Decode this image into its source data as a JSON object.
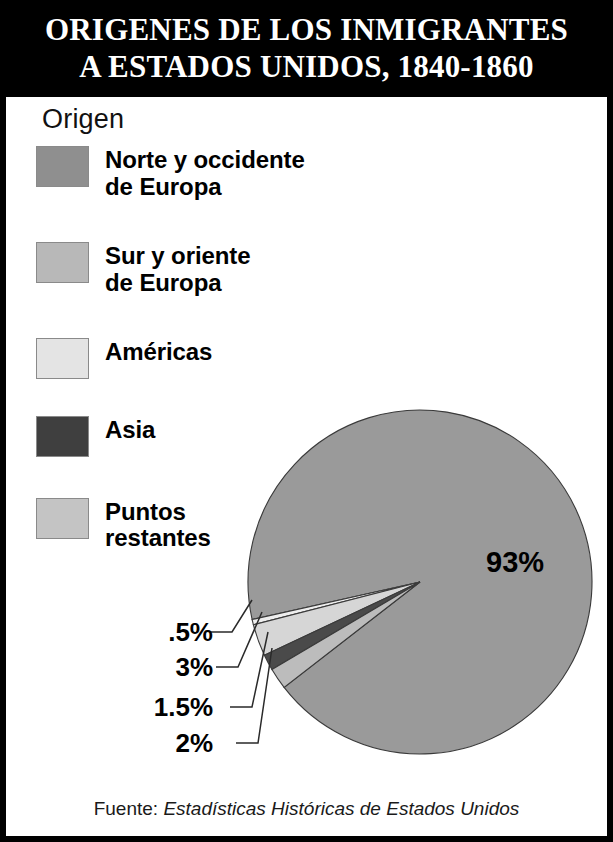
{
  "title": {
    "line1": "ORIGENES DE LOS INMIGRANTES",
    "line2": "A ESTADOS UNIDOS, 1840-1860"
  },
  "legend": {
    "heading": "Origen",
    "items": [
      {
        "label": "Norte y occidente\nde Europa",
        "color": "#8f8f8f"
      },
      {
        "label": "Sur y oriente\nde Europa",
        "color": "#b8b8b8"
      },
      {
        "label": "Américas",
        "color": "#e4e4e4"
      },
      {
        "label": "Asia",
        "color": "#3f3f3f"
      },
      {
        "label": "Puntos\nrestantes",
        "color": "#c4c4c4"
      }
    ]
  },
  "source": {
    "label": "Fuente: ",
    "publication": "Estadísticas Históricas de Estados Unidos"
  },
  "chart_data": {
    "type": "pie",
    "title": "ORIGENES DE LOS INMIGRANTES A ESTADOS UNIDOS, 1840-1860",
    "unit": "percent",
    "legend_position": "top-left",
    "center": {
      "x": 420,
      "y": 582
    },
    "radius": 172,
    "categories": [
      "Norte y occidente de Europa",
      "Sur y oriente de Europa",
      "Américas",
      "Asia",
      "Puntos restantes"
    ],
    "values": [
      93,
      0.5,
      3,
      1.5,
      2
    ],
    "labels": [
      "93%",
      ".5%",
      "3%",
      "1.5%",
      "2%"
    ],
    "colors": [
      "#9a9a9a",
      "#eeeeee",
      "#d6d6d6",
      "#4a4a4a",
      "#bcbcbc"
    ],
    "slices": [
      {
        "name": "Norte y occidente de Europa",
        "value": 93,
        "label": "93%",
        "color": "#9a9a9a",
        "start_deg": 167.4,
        "end_deg": 502.2
      },
      {
        "name": "Sur y oriente de Europa",
        "value": 0.5,
        "label": ".5%",
        "color": "#eeeeee",
        "start_deg": 165.6,
        "end_deg": 167.4
      },
      {
        "name": "Américas",
        "value": 3,
        "label": "3%",
        "color": "#d6d6d6",
        "start_deg": 154.8,
        "end_deg": 165.6
      },
      {
        "name": "Asia",
        "value": 1.5,
        "label": "1.5%",
        "color": "#4a4a4a",
        "start_deg": 149.4,
        "end_deg": 154.8
      },
      {
        "name": "Puntos restantes",
        "value": 2,
        "label": "2%",
        "color": "#bcbcbc",
        "start_deg": 142.2,
        "end_deg": 149.4
      }
    ],
    "callouts": [
      {
        "label": ".5%",
        "text_x": 213,
        "text_y": 641,
        "elbow_x": 232,
        "elbow_y": 632,
        "tip_x": 252,
        "tip_y": 600
      },
      {
        "label": "3%",
        "text_x": 213,
        "text_y": 676,
        "elbow_x": 238,
        "elbow_y": 667,
        "tip_x": 262,
        "tip_y": 612
      },
      {
        "label": "1.5%",
        "text_x": 213,
        "text_y": 716,
        "elbow_x": 252,
        "elbow_y": 707,
        "tip_x": 268,
        "tip_y": 632
      },
      {
        "label": "2%",
        "text_x": 213,
        "text_y": 752,
        "elbow_x": 258,
        "elbow_y": 743,
        "tip_x": 272,
        "tip_y": 648
      }
    ],
    "big_label": {
      "text": "93%",
      "x": 486,
      "y": 572
    }
  }
}
